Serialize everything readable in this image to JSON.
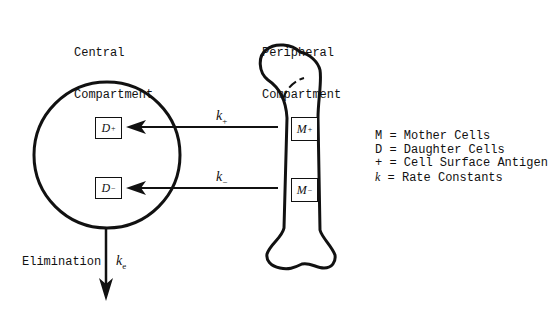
{
  "central": {
    "title_line1": "Central",
    "title_line2": "Compartment"
  },
  "peripheral": {
    "title_line1": "Peripheral",
    "title_line2": "Compartment"
  },
  "boxes": {
    "d_plus": {
      "letter": "D",
      "sign": "+"
    },
    "d_minus": {
      "letter": "D",
      "sign": "−"
    },
    "m_plus": {
      "letter": "M",
      "sign": "+"
    },
    "m_minus": {
      "letter": "M",
      "sign": "−"
    }
  },
  "rates": {
    "k_plus": {
      "symbol": "k",
      "sub": "+"
    },
    "k_minus": {
      "symbol": "k",
      "sub": "−"
    },
    "k_e": {
      "symbol": "k",
      "sub": "e"
    }
  },
  "elimination_label": "Elimination",
  "legend": [
    {
      "key": "M",
      "text": " = Mother Cells"
    },
    {
      "key": "D",
      "text": " = Daughter Cells"
    },
    {
      "key": "+",
      "text": " = Cell Surface Antigen"
    },
    {
      "key": "k",
      "text": " = Rate Constants"
    }
  ]
}
